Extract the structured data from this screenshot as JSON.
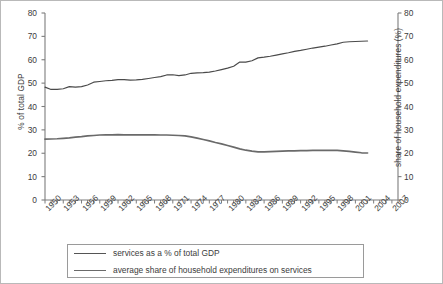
{
  "chart_data": {
    "type": "line",
    "title": "",
    "subtitle": "",
    "xlabel": "",
    "ylabel": "% of total GDP",
    "y2label": "share of household expenditures (%)",
    "xlim": [
      1950,
      2008
    ],
    "ylim": [
      0,
      80
    ],
    "y2lim": [
      0,
      80
    ],
    "ytick_labels": [
      "80",
      "70",
      "60",
      "50",
      "40",
      "30",
      "20",
      "10",
      "0"
    ],
    "ytick_values": [
      80,
      70,
      60,
      50,
      40,
      30,
      20,
      10,
      0
    ],
    "y2tick_labels": [
      "80",
      "70",
      "60",
      "50",
      "40",
      "30",
      "20",
      "10",
      "0"
    ],
    "y2tick_values": [
      80,
      70,
      60,
      50,
      40,
      30,
      20,
      10,
      0
    ],
    "xtick_labels": [
      "1950",
      "1953",
      "1956",
      "1959",
      "1962",
      "1965",
      "1968",
      "1971",
      "1974",
      "1977",
      "1980",
      "1983",
      "1986",
      "1989",
      "1992",
      "1995",
      "1998",
      "2001",
      "2004",
      "2007"
    ],
    "xtick_values": [
      1950,
      1953,
      1956,
      1959,
      1962,
      1965,
      1968,
      1971,
      1974,
      1977,
      1980,
      1983,
      1986,
      1989,
      1992,
      1995,
      1998,
      2001,
      2004,
      2007
    ],
    "minor_xticks_every": 1,
    "grid": false,
    "legend_position": "below",
    "x": [
      1950,
      1951,
      1952,
      1953,
      1954,
      1955,
      1956,
      1957,
      1958,
      1959,
      1960,
      1961,
      1962,
      1963,
      1964,
      1965,
      1966,
      1967,
      1968,
      1969,
      1970,
      1971,
      1972,
      1973,
      1974,
      1975,
      1976,
      1977,
      1978,
      1979,
      1980,
      1981,
      1982,
      1983,
      1984,
      1985,
      1986,
      1987,
      1988,
      1989,
      1990,
      1991,
      1992,
      1993,
      1994,
      1995,
      1996,
      1997,
      1998,
      1999,
      2000,
      2001,
      2002,
      2003
    ],
    "series": [
      {
        "name": "services as a % of total GDP",
        "axis": "left",
        "color": "#4a4a4a",
        "values": [
          48.3,
          47.3,
          47.3,
          47.6,
          48.5,
          48.3,
          48.5,
          49.2,
          50.4,
          50.7,
          51.0,
          51.2,
          51.5,
          51.5,
          51.3,
          51.4,
          51.6,
          52.0,
          52.4,
          52.8,
          53.5,
          53.6,
          53.2,
          53.5,
          54.2,
          54.4,
          54.5,
          54.7,
          55.2,
          55.8,
          56.4,
          57.2,
          59.0,
          59.0,
          59.6,
          60.8,
          61.1,
          61.5,
          62.0,
          62.5,
          63.0,
          63.6,
          64.0,
          64.5,
          65.0,
          65.4,
          65.8,
          66.3,
          66.8,
          67.5,
          67.7,
          67.8,
          67.9,
          68.0
        ]
      },
      {
        "name": "average share of household expenditures on services",
        "axis": "right",
        "color": "#6a6a6a",
        "values": [
          26.0,
          26.1,
          26.2,
          26.4,
          26.6,
          26.9,
          27.1,
          27.4,
          27.6,
          27.8,
          27.9,
          27.9,
          28.0,
          27.9,
          27.9,
          27.9,
          27.9,
          27.9,
          27.9,
          27.8,
          27.8,
          27.7,
          27.6,
          27.4,
          27.0,
          26.5,
          25.9,
          25.3,
          24.6,
          24.0,
          23.3,
          22.6,
          21.9,
          21.3,
          20.9,
          20.6,
          20.6,
          20.7,
          20.8,
          20.9,
          21.0,
          21.0,
          21.1,
          21.1,
          21.2,
          21.2,
          21.2,
          21.2,
          21.2,
          21.0,
          20.8,
          20.5,
          20.2,
          20.1
        ]
      }
    ]
  },
  "legend": {
    "entries": [
      {
        "label": "services as a % of total GDP"
      },
      {
        "label": "average share of household expenditures on services"
      }
    ]
  }
}
